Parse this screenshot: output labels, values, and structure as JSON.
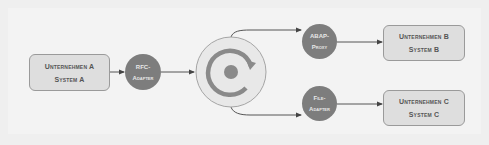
{
  "diagram": {
    "title": "",
    "nodes": {
      "system_a": {
        "line1": "Unternehmen A",
        "line2": "System A"
      },
      "rfc_adapter": {
        "line1": "RFC-",
        "line2": "Adapter"
      },
      "hub": {
        "icon": "integration-engine-cycle-icon"
      },
      "abap_proxy": {
        "line1": "ABAP-",
        "line2": "Proxy"
      },
      "file_adapter": {
        "line1": "File-",
        "line2": "Adapter"
      },
      "system_b": {
        "line1": "Unternehmen B",
        "line2": "System B"
      },
      "system_c": {
        "line1": "Unternehmen C",
        "line2": "System C"
      }
    },
    "edges": [
      {
        "from": "system_a",
        "to": "rfc_adapter"
      },
      {
        "from": "rfc_adapter",
        "to": "hub"
      },
      {
        "from": "hub",
        "to": "abap_proxy"
      },
      {
        "from": "hub",
        "to": "file_adapter"
      },
      {
        "from": "abap_proxy",
        "to": "system_b"
      },
      {
        "from": "file_adapter",
        "to": "system_c"
      }
    ],
    "colors": {
      "background": "#efefef",
      "box_fill": "#dedede",
      "box_border": "#9a9a9a",
      "node_fill": "#7d7d7d",
      "hub_fill": "#e8e8e8",
      "hub_ring": "#8a8a8a",
      "edge": "#555555"
    }
  }
}
